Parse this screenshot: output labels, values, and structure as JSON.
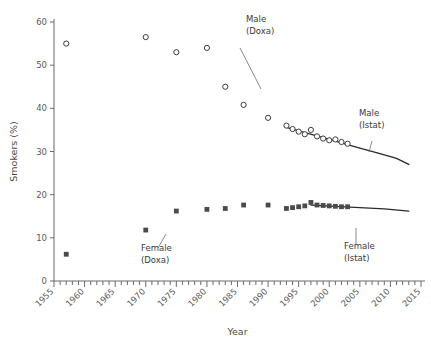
{
  "chart_data": {
    "type": "scatter",
    "title": "",
    "xlabel": "Year",
    "ylabel": "Smokers (%)",
    "xlim": [
      1955,
      2015
    ],
    "ylim": [
      0,
      60
    ],
    "yticks": [
      0,
      10,
      20,
      30,
      40,
      50,
      60
    ],
    "xticks": [
      1955,
      1960,
      1965,
      1970,
      1975,
      1980,
      1985,
      1990,
      1995,
      2000,
      2005,
      2010,
      2015
    ],
    "xtick_labels": [
      "1955",
      "1960",
      "1965",
      "1970",
      "1975",
      "1980",
      "1985",
      "1990",
      "1995",
      "2000",
      "2005",
      "2010",
      "2015"
    ],
    "ytick_labels": [
      "0",
      "10",
      "20",
      "30",
      "40",
      "50",
      "60"
    ],
    "grid": false,
    "legend_position": "inline-annotations",
    "minor_tick_interval": 1,
    "series": [
      {
        "name": "Male (Doxa)",
        "marker": "open-circle",
        "color": "#3a3a3a",
        "points": [
          {
            "x": 1957,
            "y": 55.0
          },
          {
            "x": 1970,
            "y": 56.5
          },
          {
            "x": 1975,
            "y": 53.0
          },
          {
            "x": 1980,
            "y": 54.0
          },
          {
            "x": 1983,
            "y": 45.0
          },
          {
            "x": 1986,
            "y": 40.8
          },
          {
            "x": 1990,
            "y": 37.8
          }
        ]
      },
      {
        "name": "Male (Istat)",
        "marker": "open-circle",
        "color": "#3a3a3a",
        "points": [
          {
            "x": 1993,
            "y": 36.0
          },
          {
            "x": 1994,
            "y": 35.2
          },
          {
            "x": 1995,
            "y": 34.6
          },
          {
            "x": 1996,
            "y": 34.0
          },
          {
            "x": 1997,
            "y": 35.0
          },
          {
            "x": 1998,
            "y": 33.5
          },
          {
            "x": 1999,
            "y": 33.0
          },
          {
            "x": 2000,
            "y": 32.6
          },
          {
            "x": 2001,
            "y": 32.8
          },
          {
            "x": 2002,
            "y": 32.2
          },
          {
            "x": 2003,
            "y": 31.8
          }
        ]
      },
      {
        "name": "Female (Doxa)",
        "marker": "filled-square",
        "color": "#4a4a4a",
        "points": [
          {
            "x": 1957,
            "y": 6.2
          },
          {
            "x": 1970,
            "y": 11.8
          },
          {
            "x": 1975,
            "y": 16.2
          },
          {
            "x": 1980,
            "y": 16.6
          },
          {
            "x": 1983,
            "y": 16.8
          },
          {
            "x": 1986,
            "y": 17.6
          },
          {
            "x": 1990,
            "y": 17.6
          }
        ]
      },
      {
        "name": "Female (Istat)",
        "marker": "filled-square",
        "color": "#4a4a4a",
        "points": [
          {
            "x": 1993,
            "y": 16.8
          },
          {
            "x": 1994,
            "y": 17.0
          },
          {
            "x": 1995,
            "y": 17.2
          },
          {
            "x": 1996,
            "y": 17.4
          },
          {
            "x": 1997,
            "y": 18.2
          },
          {
            "x": 1998,
            "y": 17.6
          },
          {
            "x": 1999,
            "y": 17.5
          },
          {
            "x": 2000,
            "y": 17.4
          },
          {
            "x": 2001,
            "y": 17.3
          },
          {
            "x": 2002,
            "y": 17.2
          },
          {
            "x": 2003,
            "y": 17.2
          }
        ]
      }
    ],
    "fitted_lines": [
      {
        "name": "Male (Istat) trend",
        "color": "#2a2a2a",
        "points": [
          {
            "x": 1993,
            "y": 35.6
          },
          {
            "x": 1996,
            "y": 34.4
          },
          {
            "x": 1999,
            "y": 33.2
          },
          {
            "x": 2002,
            "y": 32.0
          },
          {
            "x": 2005,
            "y": 30.8
          },
          {
            "x": 2008,
            "y": 29.6
          },
          {
            "x": 2011,
            "y": 28.4
          },
          {
            "x": 2013,
            "y": 27.0
          }
        ]
      },
      {
        "name": "Female (Istat) trend",
        "color": "#2a2a2a",
        "points": [
          {
            "x": 1997,
            "y": 17.6
          },
          {
            "x": 2001,
            "y": 17.3
          },
          {
            "x": 2005,
            "y": 17.0
          },
          {
            "x": 2009,
            "y": 16.7
          },
          {
            "x": 2013,
            "y": 16.2
          }
        ]
      }
    ],
    "annotations": [
      {
        "id": "male-doxa",
        "line1": "Male",
        "line2": "(Doxa)",
        "text_x": 246,
        "text_y": 22,
        "leader_from": [
          240,
          48
        ],
        "leader_to": [
          261,
          89
        ]
      },
      {
        "id": "male-istat",
        "line1": "Male",
        "line2": "(Istat)",
        "text_x": 359,
        "text_y": 116,
        "leader_from": [
          372,
          141
        ],
        "leader_to": [
          369,
          152
        ]
      },
      {
        "id": "female-doxa",
        "line1": "Female",
        "line2": "(Doxa)",
        "text_x": 141,
        "text_y": 251,
        "leader_from": [
          158,
          248
        ],
        "leader_to": [
          166,
          234
        ]
      },
      {
        "id": "female-istat",
        "line1": "Female",
        "line2": "(Istat)",
        "text_x": 344,
        "text_y": 249,
        "leader_from": [
          356,
          245
        ],
        "leader_to": [
          356,
          228
        ]
      }
    ]
  },
  "caption": "",
  "geometry": {
    "plot_left": 54,
    "plot_right": 421,
    "plot_top": 22,
    "plot_bottom": 281
  }
}
